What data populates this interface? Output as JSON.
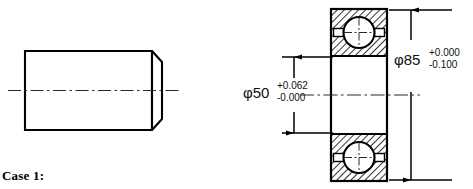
{
  "page": {
    "background_color": "#ffffff",
    "line_color": "#000000",
    "case_label": "Case 1:"
  },
  "shaft_view": {
    "name": "shaft-part-view",
    "description": "cylindrical shaft with chamfered right end, horizontal centerline"
  },
  "bearing_view": {
    "name": "ball-bearing-section-view",
    "description": "ball bearing cross-section with hatched races, balls and cage"
  },
  "dimensions": {
    "bore": {
      "symbol_value": "φ50",
      "upper_tolerance": "+0.062",
      "lower_tolerance": "-0.000"
    },
    "outer": {
      "symbol_value": "φ85",
      "upper_tolerance": "+0.000",
      "lower_tolerance": "-0.100"
    }
  }
}
